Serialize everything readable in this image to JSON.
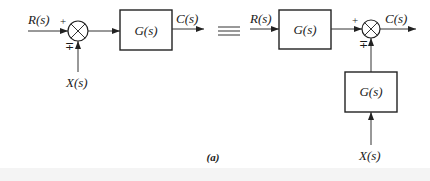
{
  "figure": {
    "caption": "(a)",
    "equivalence_symbol": "≡",
    "left_diagram": {
      "input_label": "R(s)",
      "disturbance_label": "X(s)",
      "output_label": "C(s)",
      "block_label": "G(s)",
      "sum_signs": {
        "main": "+",
        "disturbance": "∓"
      }
    },
    "right_diagram": {
      "input_label": "R(s)",
      "disturbance_label": "X(s)",
      "output_label": "C(s)",
      "forward_block_label": "G(s)",
      "disturbance_block_label": "G(s)",
      "sum_signs": {
        "main": "+",
        "disturbance": "∓"
      }
    }
  }
}
